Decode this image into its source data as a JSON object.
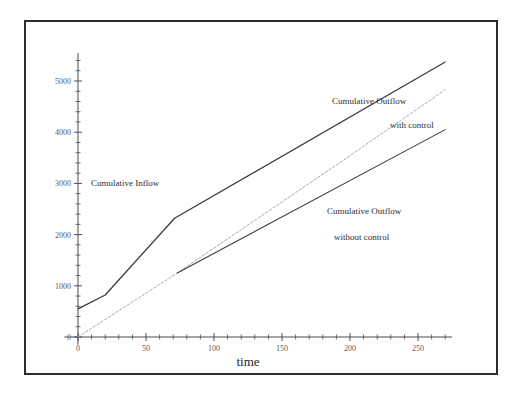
{
  "figure": {
    "background_color": "#ffffff",
    "border_color": "#2b2b33",
    "axis_color": "#4a4a52"
  },
  "chart_data": {
    "type": "line",
    "title": "",
    "subtitle": "",
    "xlabel": "time",
    "ylabel": "",
    "xlim": [
      -10,
      275
    ],
    "ylim": [
      -150,
      5550
    ],
    "grid": false,
    "legend_position": "inline-annotations",
    "xticks": [
      0,
      50,
      100,
      150,
      200,
      250
    ],
    "xtick_labels": [
      "0",
      "50",
      "100",
      "150",
      "200",
      "250"
    ],
    "xminor_step": 10,
    "yticks": [
      0,
      1000,
      2000,
      3000,
      4000,
      5000
    ],
    "ytick_labels": [
      "0",
      "1000",
      "2000",
      "3000",
      "4000",
      "5000"
    ],
    "yminor_step": 200,
    "series": [
      {
        "name": "Cumulative Inflow",
        "style": "solid",
        "color": "#3a3a44",
        "width": 1.3,
        "x": [
          0,
          20,
          71,
          270
        ],
        "values": [
          550,
          820,
          2320,
          5370
        ]
      },
      {
        "name": "Cumulative Outflow with control",
        "style": "dashed",
        "color": "#a9a9b2",
        "width": 1.0,
        "x": [
          0,
          73,
          195,
          270
        ],
        "values": [
          0,
          1250,
          3450,
          4830
        ]
      },
      {
        "name": "Cumulative Outflow without control",
        "style": "solid",
        "color": "#3a3a44",
        "width": 1.1,
        "x": [
          73,
          270
        ],
        "values": [
          1250,
          4050
        ]
      }
    ],
    "annotations": [
      {
        "id": "inflow-label",
        "text": "Cumulative Inflow",
        "x_px": 91,
        "y_px": 186
      },
      {
        "id": "outflow-with-label-1",
        "text": "Cumulative Outflow",
        "x_px": 332,
        "y_px": 104
      },
      {
        "id": "outflow-with-label-2",
        "text": "with control",
        "x_px": 390,
        "y_px": 128
      },
      {
        "id": "outflow-without-label-1",
        "text": "Cumulative Outflow",
        "x_px": 327,
        "y_px": 214
      },
      {
        "id": "outflow-without-label-2",
        "text": "without control",
        "x_px": 334,
        "y_px": 240
      }
    ]
  }
}
